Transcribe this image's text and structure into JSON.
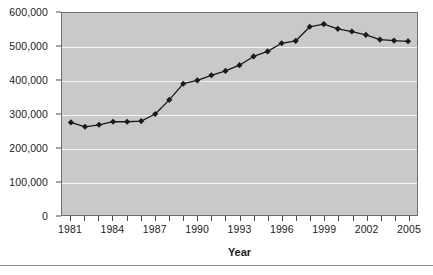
{
  "chart_data": {
    "type": "line",
    "title": "",
    "subtitle": "",
    "xlabel": "Year",
    "ylabel": "",
    "x": [
      1981,
      1982,
      1983,
      1984,
      1985,
      1986,
      1987,
      1988,
      1989,
      1990,
      1991,
      1992,
      1993,
      1994,
      1995,
      1996,
      1997,
      1998,
      1999,
      2000,
      2001,
      2002,
      2003,
      2004,
      2005
    ],
    "values": [
      275000,
      262000,
      268000,
      277000,
      277000,
      279000,
      300000,
      342000,
      390000,
      400000,
      415000,
      428000,
      445000,
      471000,
      486000,
      510000,
      517000,
      559000,
      567000,
      553000,
      545000,
      535000,
      521000,
      518000,
      516000
    ],
    "xlim": [
      1981,
      2005
    ],
    "ylim": [
      0,
      600000
    ],
    "ytick_values": [
      0,
      100000,
      200000,
      300000,
      400000,
      500000,
      600000
    ],
    "ytick_labels": [
      "0",
      "100,000",
      "200,000",
      "300,000",
      "400,000",
      "500,000",
      "600,000"
    ],
    "xtick_values": [
      1981,
      1984,
      1987,
      1990,
      1993,
      1996,
      1999,
      2002,
      2005
    ],
    "xtick_labels": [
      "1981",
      "1984",
      "1987",
      "1990",
      "1993",
      "1996",
      "1999",
      "2002",
      "2005"
    ],
    "xtick_minor_values": [
      1981,
      1982,
      1983,
      1984,
      1985,
      1986,
      1987,
      1988,
      1989,
      1990,
      1991,
      1992,
      1993,
      1994,
      1995,
      1996,
      1997,
      1998,
      1999,
      2000,
      2001,
      2002,
      2003,
      2004,
      2005
    ],
    "grid": "horizontal",
    "legend": "none",
    "marker": "diamond",
    "series_color": "#1a1a1a",
    "plot_background": "#c9c9c9",
    "gridline_color": "#f4f4f4",
    "axis_color": "#6f6f6f",
    "text_color": "#1c1c1c"
  }
}
